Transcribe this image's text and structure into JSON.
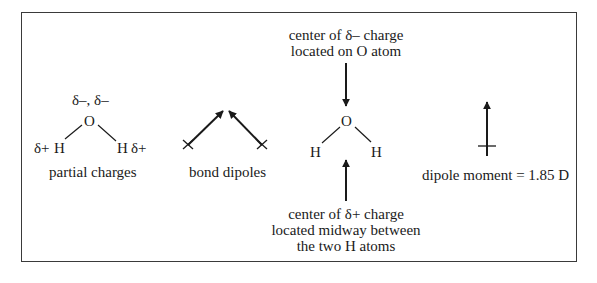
{
  "figure": {
    "panels": [
      {
        "id": "partial-charges",
        "caption": "partial charges",
        "oxygen": "O",
        "oxygen_charge": "δ–, δ–",
        "h_left": "H",
        "h_right": "H",
        "h_left_charge": "δ+",
        "h_right_charge": "δ+"
      },
      {
        "id": "bond-dipoles",
        "caption": "bond dipoles"
      },
      {
        "id": "charge-centers",
        "oxygen": "O",
        "h_left": "H",
        "h_right": "H",
        "top_label_line1": "center of δ– charge",
        "top_label_line2": "located on O atom",
        "bottom_label_line1": "center of δ+ charge",
        "bottom_label_line2": "located midway between",
        "bottom_label_line3": "the two H atoms"
      },
      {
        "id": "net-dipole",
        "caption": "dipole moment = 1.85 D",
        "value": 1.85,
        "unit": "D"
      }
    ],
    "colors": {
      "ink": "#1a1a1a",
      "frame": "#3a3a3a",
      "background": "#ffffff"
    }
  }
}
